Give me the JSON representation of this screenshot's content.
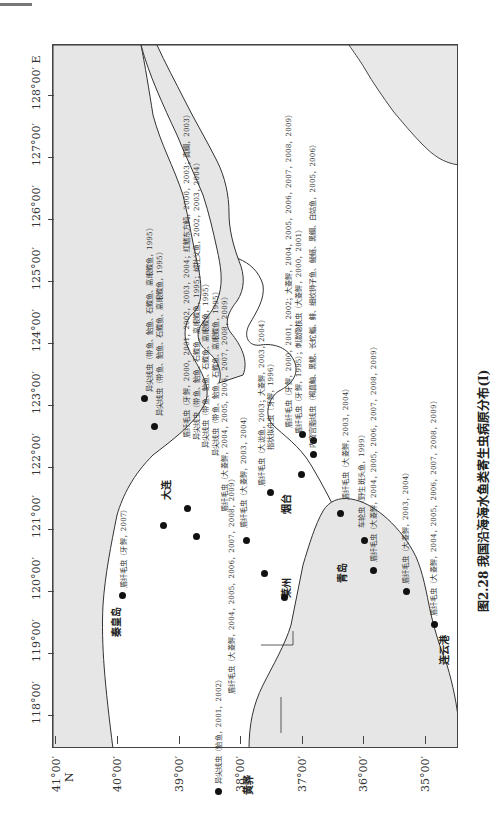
{
  "figure": {
    "caption": "图2.28  我国沿海海水鱼类寄生虫病原分布(I)",
    "orientation": "rotated 90° counter-clockwise"
  },
  "axes": {
    "latitude_labels": [
      "41°00′",
      "40°00′",
      "39°00′",
      "38°00′",
      "37°00′",
      "36°00′",
      "35°00′"
    ],
    "latitude_unit": "N",
    "longitude_labels": [
      "118°00′",
      "119°00′",
      "120°00′",
      "121°00′",
      "122°00′",
      "123°00′",
      "124°00′",
      "125°00′",
      "126°00′",
      "127°00′",
      "128°00′ E"
    ]
  },
  "places": {
    "qinhuangdao": "秦皇岛",
    "huanghua": "黄骅",
    "dalian": "大连",
    "laizhou": "莱州",
    "yantai": "烟台",
    "qingdao": "青岛",
    "lianyungang": "连云港"
  },
  "records": [
    {
      "id": "r1",
      "text": "异尖线虫（带鱼、鲐鱼、石鲽鱼、高眼鲽鱼，1995）"
    },
    {
      "id": "r2",
      "text": "异尖线虫（带鱼、鲐鱼、石鲽鱼、高眼鲽鱼，1995）"
    },
    {
      "id": "r3",
      "text": "盾纤毛虫（牙鲆，2000，2001，2002，2003，2004；红鳍东方鲀，2000，2003；真鲷，2003）"
    },
    {
      "id": "r4",
      "text": "异尖线虫（带鱼、鲐鱼、石鲽鱼、高眼鲽鱼，1995；绒杜父鱼，2002，2003，2004）"
    },
    {
      "id": "r5",
      "text": "异尖线虫（带鱼、鲐鱼、石鲽鱼、高眼鲽鱼，1995）"
    },
    {
      "id": "r6",
      "text": "异尖线虫（带鱼、鲐鱼、石鲽鱼、高眼鲽鱼，1995）"
    },
    {
      "id": "r7",
      "text": "盾纤毛虫（大菱鲆，2004，2005，2006，2007，2008，2009）"
    },
    {
      "id": "r8",
      "text": "盾纤毛虫（大菱鲆，2003，2004）"
    },
    {
      "id": "r9",
      "text": "盾纤毛虫（大泷鱼，2003；大菱鲆，2003，2004）"
    },
    {
      "id": "r10",
      "text": "指状拟舟虫（牙鲆，1996）"
    },
    {
      "id": "r11",
      "text": "盾纤毛虫（牙鲆，2000，2001，2002；大菱鲆，2004，2005，2006，2007，2008，2009）"
    },
    {
      "id": "r12",
      "text": "盾纤毛虫（牙鲆，1995）；刺激隐核虫（大菱鲆，2000，2001）"
    },
    {
      "id": "r13",
      "text": "内弯宫脂线虫（褐菖鲉、黑鲪、长蛇鲻、鲱、细纹狮子鱼、鲮鲢、黑鲷、白姑鱼，2005，2006）"
    },
    {
      "id": "r14",
      "text": "盾纤毛虫（牙鲆，2007）"
    },
    {
      "id": "r15",
      "text": "异尖线虫（鲐鱼，2001，2002）"
    },
    {
      "id": "r16",
      "text": "盾纤毛虫（大菱鲆，2004，2005，2006，2007，2008，2009）"
    },
    {
      "id": "r17",
      "text": "盾纤毛虫（大菱鲆，2003，2004）"
    },
    {
      "id": "r18",
      "text": "车轮虫（野生斑头鱼，1999）"
    },
    {
      "id": "r19",
      "text": "盾纤毛虫（大菱鲆，2004，2005，2006，2007，2008，2009）"
    },
    {
      "id": "r20",
      "text": "盾纤毛虫（大菱鲆，2003，2004）"
    },
    {
      "id": "r21",
      "text": "盾纤毛虫（大菱鲆，2004，2005，2006，2007，2008，2009）"
    }
  ],
  "colors": {
    "land": "#e8e8e8",
    "sea": "#ffffff",
    "coastline": "#333333",
    "marker": "#111111"
  }
}
